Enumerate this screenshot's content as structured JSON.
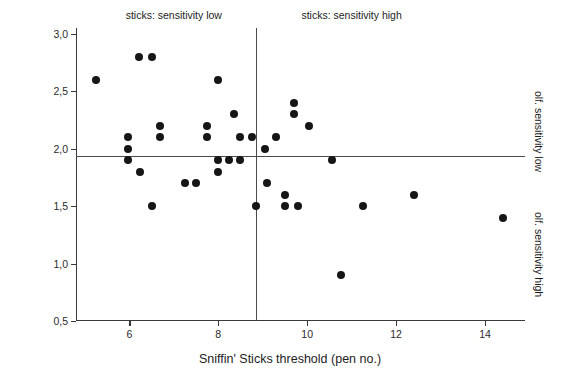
{
  "chart_data": {
    "type": "scatter",
    "title": "",
    "xlabel": "Sniffin' Sticks threshold (pen no.)",
    "ylabel": "olfactometer threshold (log ppb)",
    "xlim": [
      4.8,
      14.9
    ],
    "ylim": [
      0.5,
      3.05
    ],
    "grid": false,
    "legend": null,
    "x_ticks": [
      6,
      8,
      10,
      12,
      14
    ],
    "x_tick_labels": [
      "6",
      "8",
      "10",
      "12",
      "14"
    ],
    "y_ticks": [
      0.5,
      1.0,
      1.5,
      2.0,
      2.5,
      3.0
    ],
    "y_tick_labels": [
      "0,5",
      "1,0",
      "1,5",
      "2,0",
      "2,5",
      "3,0"
    ],
    "reference_lines": {
      "vertical_x": 8.85,
      "horizontal_y": 1.94
    },
    "annotations": [
      {
        "name": "sticks-sensitivity-low",
        "text": "sticks: sensitivity low",
        "position": "top-left",
        "x": 7.0
      },
      {
        "name": "sticks-sensitivity-high",
        "text": "sticks: sensitivity high",
        "position": "top-right",
        "x": 11.0
      },
      {
        "name": "olf-sensitivity-low",
        "text": "olf. sensitivity low",
        "position": "right-upper",
        "y": 2.5
      },
      {
        "name": "olf-sensitivity-high",
        "text": "olf. sensitivity high",
        "position": "right-lower",
        "y": 1.45
      }
    ],
    "marker": {
      "shape": "circle",
      "color": "#161616",
      "size": 8
    },
    "points": [
      {
        "x": 5.25,
        "y": 2.6
      },
      {
        "x": 5.98,
        "y": 2.1
      },
      {
        "x": 5.98,
        "y": 2.0
      },
      {
        "x": 5.98,
        "y": 1.9
      },
      {
        "x": 6.22,
        "y": 2.8
      },
      {
        "x": 6.5,
        "y": 2.8
      },
      {
        "x": 6.25,
        "y": 1.8
      },
      {
        "x": 6.5,
        "y": 1.5
      },
      {
        "x": 6.7,
        "y": 2.2
      },
      {
        "x": 6.7,
        "y": 2.1
      },
      {
        "x": 7.25,
        "y": 1.7
      },
      {
        "x": 7.5,
        "y": 1.7
      },
      {
        "x": 7.75,
        "y": 2.2
      },
      {
        "x": 7.75,
        "y": 2.1
      },
      {
        "x": 8.0,
        "y": 2.6
      },
      {
        "x": 8.0,
        "y": 1.9
      },
      {
        "x": 8.0,
        "y": 1.8
      },
      {
        "x": 8.25,
        "y": 1.9
      },
      {
        "x": 8.5,
        "y": 1.9
      },
      {
        "x": 8.35,
        "y": 2.3
      },
      {
        "x": 8.5,
        "y": 2.1
      },
      {
        "x": 8.75,
        "y": 2.1
      },
      {
        "x": 8.85,
        "y": 1.5
      },
      {
        "x": 9.05,
        "y": 2.0
      },
      {
        "x": 9.1,
        "y": 1.7
      },
      {
        "x": 9.3,
        "y": 2.1
      },
      {
        "x": 9.5,
        "y": 1.6
      },
      {
        "x": 9.5,
        "y": 1.5
      },
      {
        "x": 9.7,
        "y": 2.4
      },
      {
        "x": 9.7,
        "y": 2.3
      },
      {
        "x": 9.8,
        "y": 1.5
      },
      {
        "x": 10.05,
        "y": 2.2
      },
      {
        "x": 10.55,
        "y": 1.9
      },
      {
        "x": 10.75,
        "y": 0.9
      },
      {
        "x": 11.25,
        "y": 1.5
      },
      {
        "x": 12.4,
        "y": 1.6
      },
      {
        "x": 14.4,
        "y": 1.4
      }
    ]
  },
  "axis": {
    "x_title": "Sniffin' Sticks threshold (pen no.)",
    "y_title": "olfactometer threshold (log ppb)"
  }
}
